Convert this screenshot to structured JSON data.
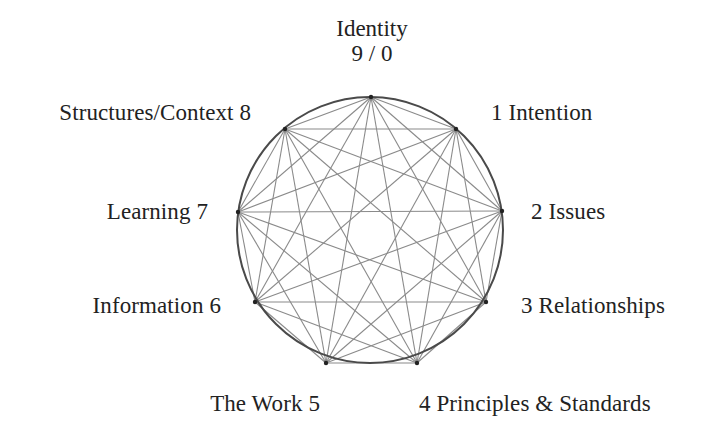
{
  "diagram": {
    "type": "enneagram-complete-graph",
    "circle": {
      "cx": 370,
      "cy": 230,
      "r": 133,
      "stroke": "#4a4a4a",
      "stroke_width": 2
    },
    "line_color": "#8a8a8a",
    "vertex_color": "#222222",
    "top": {
      "name": "Identity",
      "number": "9 / 0"
    },
    "nodes": [
      {
        "id": 0,
        "label": "Identity 9 / 0",
        "x": 371,
        "y": 97
      },
      {
        "id": 1,
        "label": "1 Intention",
        "x": 456,
        "y": 129
      },
      {
        "id": 2,
        "label": "2 Issues",
        "x": 502,
        "y": 211
      },
      {
        "id": 3,
        "label": "3 Relationships",
        "x": 486,
        "y": 302
      },
      {
        "id": 4,
        "label": "4 Principles & Standards",
        "x": 417,
        "y": 363
      },
      {
        "id": 5,
        "label": "The Work 5",
        "x": 326,
        "y": 363
      },
      {
        "id": 6,
        "label": "Information 6",
        "x": 255,
        "y": 302
      },
      {
        "id": 7,
        "label": "Learning 7",
        "x": 238,
        "y": 212
      },
      {
        "id": 8,
        "label": "Structures/Context 8",
        "x": 285,
        "y": 129
      }
    ],
    "labels": {
      "n1": "1 Intention",
      "n2": "2 Issues",
      "n3": "3 Relationships",
      "n4": "4 Principles & Standards",
      "n5": "The Work 5",
      "n6": "Information 6",
      "n7": "Learning 7",
      "n8": "Structures/Context 8"
    },
    "edges": "all-pairs"
  }
}
